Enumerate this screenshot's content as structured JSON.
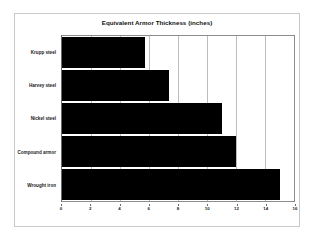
{
  "chart_data": {
    "type": "bar",
    "orientation": "horizontal",
    "title": "Equivalent Armor Thickness (inches)",
    "xlabel": "",
    "ylabel": "",
    "categories": [
      "Krupp steel",
      "Harvey steel",
      "Nickel steel",
      "Compound armor",
      "Wrought iron"
    ],
    "values": [
      5.7,
      7.4,
      11,
      12,
      15
    ],
    "xlim": [
      0,
      16
    ],
    "xticks": [
      0,
      2,
      4,
      6,
      8,
      10,
      12,
      14,
      16
    ],
    "xtick_labels": [
      "0",
      "2",
      "4",
      "6",
      "8",
      "10",
      "12",
      "14",
      "16"
    ],
    "grid": "vertical",
    "legend": "none",
    "bar_color": "#000000",
    "plot_background": "#ffffff",
    "figure_border_color": "#c9c9c9"
  }
}
